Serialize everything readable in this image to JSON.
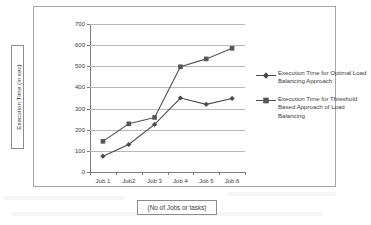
{
  "chart_data": {
    "type": "line",
    "title": "",
    "xlabel": "(No of Jobs or tasks)",
    "ylabel": "Execution Time (in sec)",
    "categories": [
      "Job 1",
      "Job2",
      "Job 3",
      "Job 4",
      "Job 5",
      "Job 6"
    ],
    "ylim": [
      0,
      700
    ],
    "ytick_values": [
      0,
      100,
      200,
      300,
      400,
      500,
      600,
      700
    ],
    "ytick_labels": [
      "0",
      "100",
      "200",
      "300",
      "400",
      "500",
      "600",
      "700"
    ],
    "grid": true,
    "legend_position": "right",
    "series": [
      {
        "name": "Execution Time for Optimal Load Balancing Approach",
        "marker": "diamond",
        "color": "#4a4a4a",
        "values": [
          75,
          130,
          225,
          350,
          320,
          348
        ]
      },
      {
        "name": "Execution Time for Threshold Based Approach of Load Balancing",
        "marker": "square",
        "color": "#555555",
        "values": [
          145,
          228,
          258,
          498,
          535,
          585
        ]
      }
    ]
  },
  "legend": {
    "entries": [
      {
        "label": "Execution Time for Optimal Load Balancing Approach",
        "marker": "diamond"
      },
      {
        "label": "Execution Time for Threshold Based Approach of Load Balancing",
        "marker": "square"
      }
    ]
  },
  "axes": {
    "y_title": "Execution Time (in sec)",
    "x_title": "(No of Jobs or tasks)"
  },
  "colors": {
    "series_1": "#4a4a4a",
    "series_2": "#555555",
    "gridline": "#b8b8b8",
    "axis": "#7d7d7d",
    "frame": "#a6a6a6",
    "text": "#3a3a3a",
    "background": "#ffffff"
  }
}
